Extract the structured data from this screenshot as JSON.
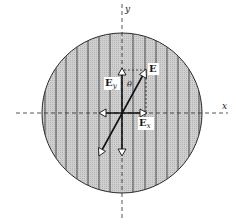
{
  "diagram": {
    "axes": {
      "x_label": "x",
      "y_label": "y"
    },
    "vectors": {
      "E": {
        "label": "E"
      },
      "Ey": {
        "label": "E",
        "subscript": "y"
      },
      "Ex": {
        "label": "E",
        "subscript": "x"
      }
    },
    "angle_label": "θ",
    "colors": {
      "disk_fill": "#c8c8c8",
      "stripe": "#3a3a3a",
      "ink": "#1a1a1a",
      "arrowhead_fill": "#ffffff"
    }
  }
}
